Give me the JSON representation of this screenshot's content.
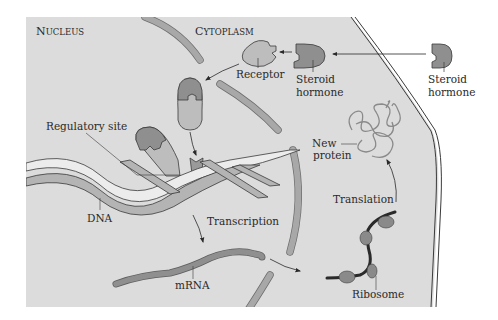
{
  "regions": {
    "nucleus": {
      "first": "N",
      "rest": "UCLEUS"
    },
    "cytoplasm": {
      "first": "C",
      "rest": "YTOPLASM"
    }
  },
  "labels": {
    "receptor": "Receptor",
    "steroid_hormone_inside_1": "Steroid",
    "steroid_hormone_inside_2": "hormone",
    "steroid_hormone_outside_1": "Steroid",
    "steroid_hormone_outside_2": "hormone",
    "regulatory_site": "Regulatory site",
    "new_protein_1": "New",
    "new_protein_2": "protein",
    "translation": "Translation",
    "transcription": "Transcription",
    "dna": "DNA",
    "mrna": "mRNA",
    "ribosome": "Ribosome"
  },
  "colors": {
    "background": "#ffffff",
    "cell_fill": "#dcdcdc",
    "envelope": "#a8a8a8",
    "hormone": "#8f8f8f",
    "receptor": "#bdbdbd",
    "dna_light": "#ececec",
    "dna_dark": "#b4b4b4",
    "ribosome": "#8a8a8a",
    "ink": "#2a2a2a"
  }
}
